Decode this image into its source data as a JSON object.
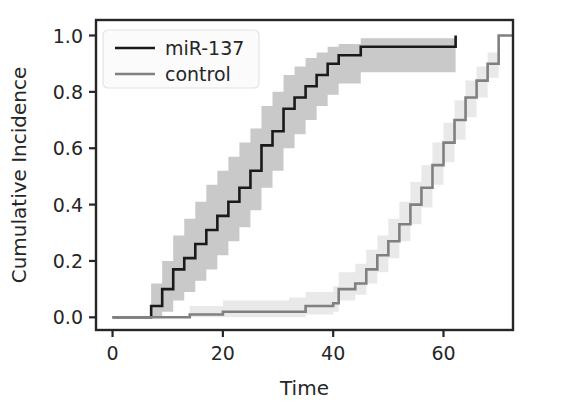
{
  "chart_data": {
    "type": "line",
    "title": "",
    "xlabel": "Time",
    "ylabel": "Cumulative Incidence",
    "xlim": [
      -3.0,
      72.6
    ],
    "ylim": [
      -0.045,
      1.055
    ],
    "xticks": [
      0,
      20,
      40,
      60
    ],
    "xticklabels": [
      "0",
      "20",
      "40",
      "60"
    ],
    "yticks": [
      0.0,
      0.2,
      0.4,
      0.6,
      0.8,
      1.0
    ],
    "yticklabels": [
      "0.0",
      "0.2",
      "0.4",
      "0.6",
      "0.8",
      "1.0"
    ],
    "grid": false,
    "legend_position": "upper left",
    "step_type": "post",
    "series": [
      {
        "name": "miR-137",
        "color": "#1a1a1a",
        "band_color": "#c9c9c9",
        "linewidth": 2.6,
        "x": [
          0,
          5,
          7,
          9,
          11,
          13,
          15,
          17,
          19,
          21,
          23,
          25,
          27,
          29,
          31,
          33,
          35,
          37,
          39,
          41,
          45,
          62,
          62.2
        ],
        "y": [
          0.0,
          0.0,
          0.04,
          0.1,
          0.17,
          0.21,
          0.26,
          0.31,
          0.36,
          0.41,
          0.46,
          0.52,
          0.61,
          0.66,
          0.74,
          0.78,
          0.82,
          0.86,
          0.9,
          0.93,
          0.96,
          0.96,
          1.0
        ],
        "y_lower": [
          0.0,
          0.0,
          0.0,
          0.02,
          0.06,
          0.09,
          0.13,
          0.17,
          0.22,
          0.27,
          0.32,
          0.38,
          0.46,
          0.52,
          0.6,
          0.65,
          0.7,
          0.75,
          0.79,
          0.83,
          0.87,
          0.87,
          1.0
        ],
        "y_upper": [
          0.0,
          0.0,
          0.12,
          0.2,
          0.29,
          0.35,
          0.41,
          0.47,
          0.52,
          0.57,
          0.62,
          0.67,
          0.75,
          0.8,
          0.86,
          0.89,
          0.92,
          0.94,
          0.96,
          0.97,
          0.99,
          0.99,
          1.0
        ]
      },
      {
        "name": "control",
        "color": "#808080",
        "band_color": "#e9e9e9",
        "linewidth": 2.6,
        "x": [
          0,
          9,
          14,
          20,
          32,
          35,
          40,
          41,
          44,
          46,
          48,
          50,
          52,
          54,
          56,
          58,
          60,
          62,
          64,
          66,
          68,
          70,
          72.6
        ],
        "y": [
          0.0,
          0.0,
          0.01,
          0.02,
          0.02,
          0.04,
          0.05,
          0.1,
          0.12,
          0.17,
          0.22,
          0.27,
          0.33,
          0.4,
          0.46,
          0.54,
          0.62,
          0.7,
          0.78,
          0.84,
          0.9,
          1.0,
          1.0
        ],
        "y_lower": [
          0.0,
          0.0,
          0.0,
          0.0,
          0.0,
          0.01,
          0.02,
          0.06,
          0.08,
          0.12,
          0.16,
          0.21,
          0.27,
          0.33,
          0.39,
          0.47,
          0.55,
          0.63,
          0.71,
          0.78,
          0.85,
          1.0,
          1.0
        ],
        "y_upper": [
          0.0,
          0.0,
          0.04,
          0.06,
          0.07,
          0.09,
          0.11,
          0.16,
          0.19,
          0.24,
          0.29,
          0.35,
          0.41,
          0.48,
          0.54,
          0.62,
          0.69,
          0.77,
          0.84,
          0.89,
          0.94,
          1.0,
          1.0
        ]
      }
    ]
  },
  "legend": {
    "entries": [
      {
        "label": "miR-137"
      },
      {
        "label": "control"
      }
    ]
  },
  "colors": {
    "axis": "#262626",
    "background": "#ffffff",
    "mir137_line": "#1a1a1a",
    "mir137_band": "#c9c9c9",
    "control_line": "#808080",
    "control_band": "#e9e9e9"
  }
}
